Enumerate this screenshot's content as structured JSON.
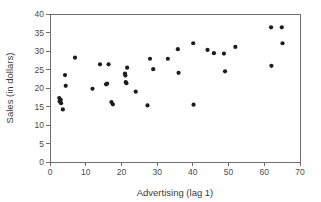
{
  "chart_data": {
    "type": "scatter",
    "title": "",
    "xlabel": "Advertising (lag 1)",
    "ylabel": "Sales (in dollars)",
    "xlim": [
      0,
      70
    ],
    "ylim": [
      0,
      40
    ],
    "xticks": [
      0,
      10,
      20,
      30,
      40,
      50,
      60,
      70
    ],
    "yticks": [
      0,
      5,
      10,
      15,
      20,
      25,
      30,
      35,
      40
    ],
    "xticklabels": [
      "0",
      "10",
      "20",
      "30",
      "40",
      "50",
      "60",
      "70"
    ],
    "yticklabels": [
      "0",
      "5",
      "10",
      "15",
      "20",
      "25",
      "30",
      "35",
      "40"
    ],
    "grid": false,
    "legend": null,
    "marker": "filled-circle",
    "marker_color": "#1c1c1c",
    "marker_size": 4,
    "points": [
      {
        "x": 2.6,
        "y": 17.3
      },
      {
        "x": 2.7,
        "y": 16.4
      },
      {
        "x": 3.0,
        "y": 16.8
      },
      {
        "x": 3.1,
        "y": 15.9
      },
      {
        "x": 3.6,
        "y": 14.2
      },
      {
        "x": 4.2,
        "y": 23.5
      },
      {
        "x": 4.4,
        "y": 20.6
      },
      {
        "x": 7.0,
        "y": 28.2
      },
      {
        "x": 11.9,
        "y": 19.8
      },
      {
        "x": 14.0,
        "y": 26.4
      },
      {
        "x": 15.7,
        "y": 21.0
      },
      {
        "x": 16.0,
        "y": 21.2
      },
      {
        "x": 16.4,
        "y": 26.4
      },
      {
        "x": 17.2,
        "y": 16.2
      },
      {
        "x": 17.6,
        "y": 15.6
      },
      {
        "x": 21.0,
        "y": 23.9
      },
      {
        "x": 21.1,
        "y": 23.4
      },
      {
        "x": 21.2,
        "y": 21.6
      },
      {
        "x": 21.4,
        "y": 21.3
      },
      {
        "x": 21.6,
        "y": 25.5
      },
      {
        "x": 24.0,
        "y": 19.0
      },
      {
        "x": 27.3,
        "y": 15.3
      },
      {
        "x": 28.0,
        "y": 27.9
      },
      {
        "x": 28.9,
        "y": 25.1
      },
      {
        "x": 33.0,
        "y": 27.9
      },
      {
        "x": 35.8,
        "y": 30.5
      },
      {
        "x": 36.0,
        "y": 24.1
      },
      {
        "x": 40.1,
        "y": 32.1
      },
      {
        "x": 40.2,
        "y": 15.5
      },
      {
        "x": 44.1,
        "y": 30.3
      },
      {
        "x": 45.9,
        "y": 29.4
      },
      {
        "x": 48.7,
        "y": 29.3
      },
      {
        "x": 49.0,
        "y": 24.5
      },
      {
        "x": 51.9,
        "y": 31.1
      },
      {
        "x": 61.9,
        "y": 36.4
      },
      {
        "x": 62.0,
        "y": 26.0
      },
      {
        "x": 64.9,
        "y": 36.4
      },
      {
        "x": 65.1,
        "y": 32.1
      }
    ]
  }
}
